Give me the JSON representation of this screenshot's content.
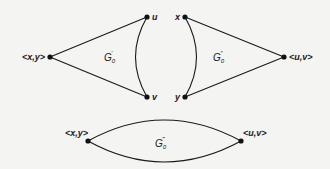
{
  "diagram": {
    "type": "graph-gadgets",
    "edge_color": "#1a1a1a",
    "background": "#f4f4f2",
    "gadgets": [
      {
        "id": "g0prime",
        "label": "G",
        "subscript": "0",
        "superscript": "′",
        "vertices": [
          {
            "id": "xy",
            "label": "<x,y>"
          },
          {
            "id": "u",
            "label": "u"
          },
          {
            "id": "v",
            "label": "v"
          }
        ],
        "edges": [
          [
            "xy",
            "u"
          ],
          [
            "xy",
            "v"
          ],
          [
            "u",
            "v",
            "curved"
          ]
        ]
      },
      {
        "id": "g0doubleprime",
        "label": "G",
        "subscript": "0",
        "superscript": "″",
        "vertices": [
          {
            "id": "x",
            "label": "x"
          },
          {
            "id": "y",
            "label": "y"
          },
          {
            "id": "uv",
            "label": "<u,v>"
          }
        ],
        "edges": [
          [
            "x",
            "uv"
          ],
          [
            "y",
            "uv"
          ],
          [
            "x",
            "y",
            "curved"
          ]
        ]
      },
      {
        "id": "g0tripleprime",
        "label": "G",
        "subscript": "0",
        "superscript": "‴",
        "vertices": [
          {
            "id": "xy",
            "label": "<x,y>"
          },
          {
            "id": "uv",
            "label": "<u,v>"
          }
        ],
        "edges": [
          [
            "xy",
            "uv",
            "curved-upper"
          ],
          [
            "xy",
            "uv",
            "curved-lower"
          ]
        ]
      }
    ]
  }
}
